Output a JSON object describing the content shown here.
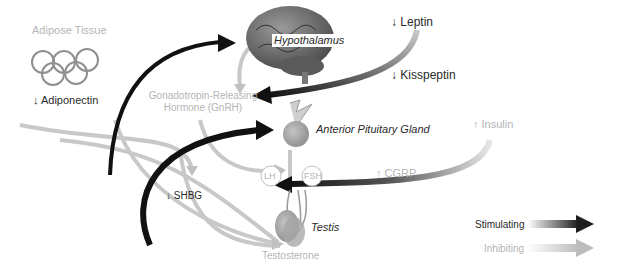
{
  "labels": {
    "adipose_tissue": "Adipose Tissue",
    "adiponectin": "↓ Adiponectin",
    "hypothalamus": "Hypothalamus",
    "leptin": "↓ Leptin",
    "kisspeptin": "↓ Kisspeptin",
    "gnrh_line1": "Gonadotropin-Releasing",
    "gnrh_line2": "Hormone (GnRH)",
    "anterior_pituitary": "Anterior Pituitary Gland",
    "insulin": "↑ Insulin",
    "lh": "LH",
    "fsh": "FSH",
    "cgrp": "↑ CGRP",
    "shbg": "↓ SHBG",
    "testis": "Testis",
    "testosterone": "Testosterone"
  },
  "legend": {
    "stimulating": "Stimulating",
    "inhibiting": "Inhibiting"
  },
  "colors": {
    "stimulating": "#1e1e1e",
    "inhibiting": "#bdbdbd",
    "organ": "#9a9a9a"
  }
}
